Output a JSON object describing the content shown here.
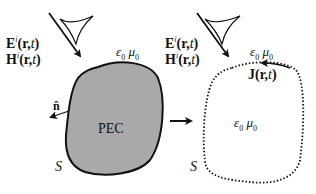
{
  "diagram": {
    "left_panel": {
      "incident_E": "E",
      "incident_E_sup": "i",
      "incident_H": "H",
      "incident_H_sup": "i",
      "args": "(r,",
      "arg_t": "t",
      "close": ")",
      "medium_eps": "ε",
      "medium_sub0": "0",
      "medium_mu": "μ",
      "object_label": "PEC",
      "normal_label": "n̂",
      "surface_label": "S"
    },
    "right_panel": {
      "incident_E": "E",
      "incident_E_sup": "i",
      "incident_H": "H",
      "incident_H_sup": "i",
      "args": "(r,",
      "arg_t": "t",
      "close": ")",
      "medium_eps": "ε",
      "medium_sub0": "0",
      "medium_mu": "μ",
      "current_J": "J",
      "current_args": "(r,",
      "current_t": "t",
      "current_close": ")",
      "interior_eps": "ε",
      "interior_mu": "μ",
      "surface_label": "S"
    },
    "colors": {
      "pec_fill": "#a9a9a9",
      "stroke": "#111111"
    }
  }
}
